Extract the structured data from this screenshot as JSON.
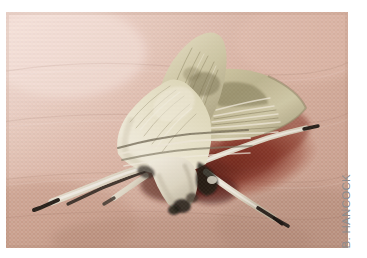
{
  "figure": {
    "kind": "photograph",
    "subject_description": "Pale greenish-cream moth resting on pinkish-tan fabric",
    "credit": "B. HANCOCK",
    "credit_orientation": "vertical-bottom-to-top",
    "page_background": "#ffffff"
  },
  "photo": {
    "alt": "A pale cream and olive-green moth with folded wings resting on a pinkish fabric surface, casting a dark red shadow",
    "frame": {
      "x": 6,
      "y": 12,
      "width": 342,
      "height": 236
    },
    "colors": {
      "background_top_left": "#f7e2db",
      "background_top_right": "#dcb7a9",
      "background_bottom_left": "#c49c8a",
      "background_bottom_right": "#b8907f",
      "fabric_mid": "#d5ab9b",
      "shadow_dark_red": "#6e2218",
      "shadow_red": "#8d3326",
      "moth_body_light": "#e9e5cf",
      "moth_body_mid": "#cfc9a6",
      "moth_wing_olive": "#a9a37c",
      "moth_wing_dark": "#7d7752",
      "moth_highlight": "#f3efe0",
      "moth_dark_detail": "#2b2620",
      "leg_pale": "#efeade",
      "antenna_dark": "#241f1a"
    }
  },
  "credit_style": {
    "color": "#8c8c8c",
    "font_size_px": 11.5
  }
}
